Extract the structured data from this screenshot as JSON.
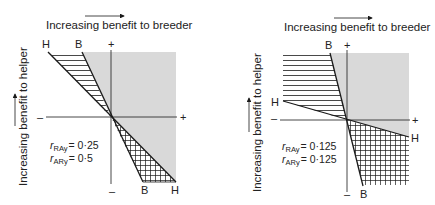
{
  "colors": {
    "shade": "#d9d9d9",
    "line": "#1a1a1a",
    "text": "#222222",
    "background": "#ffffff"
  },
  "panels": [
    {
      "id": "left",
      "x_axis_label": "Increasing benefit to breeder",
      "y_axis_label": "Increasing benefit to helper",
      "axis_signs": {
        "top": "+",
        "bottom": "–",
        "left": "–",
        "right": "+"
      },
      "line_labels": {
        "top_h": "H",
        "top_b": "B",
        "bottom_b": "B",
        "bottom_h": "H"
      },
      "relatedness": [
        {
          "symbol": "r",
          "subscript": "RAy",
          "equals": "= 0·25"
        },
        {
          "symbol": "r",
          "subscript": "ARy",
          "equals": "= 0·5"
        }
      ]
    },
    {
      "id": "right",
      "x_axis_label": "Increasing benefit to breeder",
      "y_axis_label": "Increasing benefit to helper",
      "axis_signs": {
        "top": "+",
        "bottom": "–",
        "left": "–",
        "right": "+"
      },
      "line_labels": {
        "top_b": "B",
        "left_h": "H",
        "right_h": "H",
        "bottom_b": "B"
      },
      "relatedness": [
        {
          "symbol": "r",
          "subscript": "RAy",
          "equals": "= 0·125"
        },
        {
          "symbol": "r",
          "subscript": "ARy",
          "equals": "= 0·125"
        }
      ]
    }
  ]
}
